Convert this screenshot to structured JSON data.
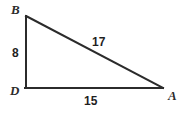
{
  "figure": {
    "type": "right-triangle-geometry-diagram",
    "background_color": "#ffffff",
    "stroke_color": "#2b2b2b",
    "label_color": "#1f1f1f",
    "vertices": [
      {
        "name": "B",
        "label": "B",
        "x": 26,
        "y": 16
      },
      {
        "name": "D",
        "label": "D",
        "x": 26,
        "y": 88
      },
      {
        "name": "A",
        "label": "A",
        "x": 162,
        "y": 88
      }
    ],
    "sides": [
      {
        "name": "leg-vertical",
        "from": "B",
        "to": "D",
        "label": "8"
      },
      {
        "name": "hypotenuse",
        "from": "B",
        "to": "A",
        "label": "17"
      },
      {
        "name": "leg-horizontal",
        "from": "D",
        "to": "A",
        "label": "15"
      }
    ],
    "labels": {
      "vertex_b": "B",
      "vertex_d": "D",
      "vertex_a": "A",
      "side_bd": "8",
      "side_ba": "17",
      "side_da": "15"
    }
  }
}
